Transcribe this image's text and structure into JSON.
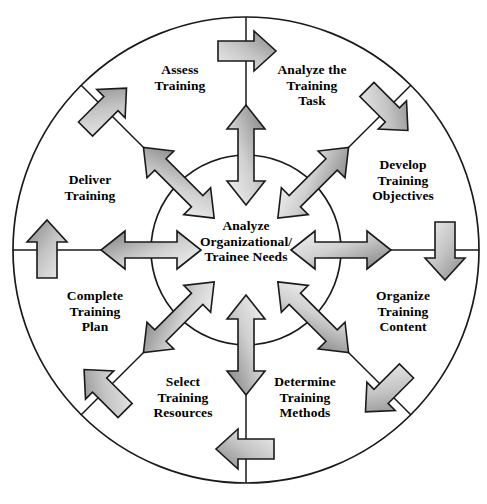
{
  "diagram": {
    "type": "cyclical-process-wheel",
    "hub": {
      "name": "hub",
      "label": "Analyze\nOrganizational/\nTrainee Needs",
      "cx": 246,
      "cy": 250,
      "r": 95
    },
    "outer_circle": {
      "cx": 246,
      "cy": 250,
      "r": 233
    },
    "colors": {
      "stroke": "#1a1a1a",
      "background": "#ffffff",
      "text": "#000000",
      "arrow_light": "#f2f2f2",
      "arrow_mid": "#c9c9c9",
      "arrow_dark": "#808080",
      "arrow_outline": "#1a1a1a"
    },
    "flow_direction": "clockwise",
    "sectors": [
      {
        "id": "assess-training",
        "label": "Assess\nTraining",
        "angle_deg": -67.5,
        "x": 180,
        "y": 62,
        "order": 8
      },
      {
        "id": "analyze-training-task",
        "label": "Analyze the\nTraining\nTask",
        "angle_deg": -22.5,
        "x": 312,
        "y": 62,
        "order": 1
      },
      {
        "id": "develop-objectives",
        "label": "Develop\nTraining\nObjectives",
        "angle_deg": 22.5,
        "x": 403,
        "y": 157,
        "order": 2
      },
      {
        "id": "organize-content",
        "label": "Organize\nTraining\nContent",
        "angle_deg": 67.5,
        "x": 403,
        "y": 288,
        "order": 3
      },
      {
        "id": "determine-methods",
        "label": "Determine\nTraining\nMethods",
        "angle_deg": 112.5,
        "x": 305,
        "y": 374,
        "order": 4
      },
      {
        "id": "select-resources",
        "label": "Select\nTraining\nResources",
        "angle_deg": 157.5,
        "x": 183,
        "y": 374,
        "order": 5
      },
      {
        "id": "complete-plan",
        "label": "Complete\nTraining\nPlan",
        "angle_deg": 202.5,
        "x": 95,
        "y": 288,
        "order": 6
      },
      {
        "id": "deliver-training",
        "label": "Deliver\nTraining",
        "angle_deg": 247.5,
        "x": 90,
        "y": 172,
        "order": 7
      }
    ],
    "spokes": {
      "name": "sector-divider-lines",
      "count": 8,
      "angles_deg": [
        0,
        45,
        90,
        135,
        180,
        225,
        270,
        315
      ]
    },
    "hub_arrows": {
      "name": "bidirectional-hub-arrows",
      "count": 8,
      "style": "double-headed",
      "angles_deg": [
        0,
        45,
        90,
        135,
        180,
        225,
        270,
        315
      ]
    },
    "ring_arrows": {
      "name": "clockwise-ring-arrows",
      "count": 8,
      "style": "single-headed",
      "angles_deg": [
        0,
        45,
        90,
        135,
        180,
        225,
        270,
        315
      ]
    }
  }
}
